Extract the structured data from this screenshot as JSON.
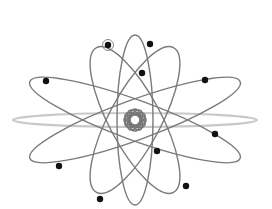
{
  "diagram": {
    "colors": {
      "background": "#ffffff",
      "orbit": "#7a7a7a",
      "faint_orbit": "#c8c8c8",
      "electron": "#111111"
    },
    "center": [
      135,
      120
    ],
    "orbits": [
      {
        "id": "vertical",
        "rx": 18,
        "ry": 85,
        "rotate": 0
      },
      {
        "id": "tilt-left",
        "rx": 26,
        "ry": 82,
        "rotate": -28
      },
      {
        "id": "tilt-right",
        "rx": 26,
        "ry": 82,
        "rotate": 28
      },
      {
        "id": "wide-down",
        "rx": 112,
        "ry": 20,
        "rotate": 20
      },
      {
        "id": "wide-up",
        "rx": 112,
        "ry": 20,
        "rotate": -20
      }
    ],
    "faint_orbit": {
      "rx": 122,
      "ry": 7,
      "rotate": 0
    },
    "electrons": [
      {
        "x": 108,
        "y": 45,
        "highlighted": true
      },
      {
        "x": 150,
        "y": 44
      },
      {
        "x": 142,
        "y": 73
      },
      {
        "x": 46,
        "y": 81
      },
      {
        "x": 205,
        "y": 80
      },
      {
        "x": 215,
        "y": 134
      },
      {
        "x": 157,
        "y": 151
      },
      {
        "x": 59,
        "y": 166
      },
      {
        "x": 186,
        "y": 186
      },
      {
        "x": 100,
        "y": 199
      }
    ]
  }
}
